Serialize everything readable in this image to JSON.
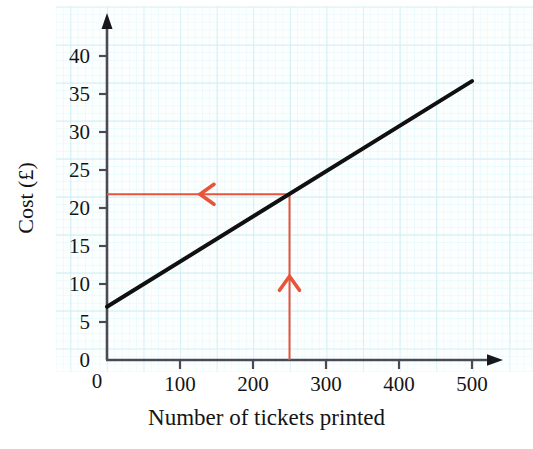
{
  "chart_data": {
    "type": "line",
    "title": "",
    "subtitle": "",
    "xlabel": "Number of tickets printed",
    "ylabel": "Cost (£)",
    "xlim": [
      0,
      540
    ],
    "ylim": [
      0,
      43
    ],
    "xticks": [
      0,
      100,
      200,
      300,
      400,
      500
    ],
    "yticks": [
      0,
      5,
      10,
      15,
      20,
      25,
      30,
      35,
      40
    ],
    "xtick_labels": [
      "0",
      "100",
      "200",
      "300",
      "400",
      "500"
    ],
    "ytick_labels": [
      "0",
      "5",
      "10",
      "15",
      "20",
      "25",
      "30",
      "35",
      "40"
    ],
    "grid": true,
    "grid_minor": true,
    "legend": false,
    "legend_position": "none",
    "series": [
      {
        "name": "Cost of printing tickets",
        "color": "#101010",
        "line_width": 4,
        "x": [
          0,
          500
        ],
        "y": [
          7,
          36.7
        ],
        "intercept": 7,
        "slope_per_100": 5.94
      }
    ],
    "annotations": [
      {
        "name": "reading-vertical",
        "type": "arrow",
        "color": "#e8533a",
        "direction": "up",
        "from_x": 250,
        "from_y": 0,
        "to_x": 250,
        "to_y": 21.8,
        "label": ""
      },
      {
        "name": "reading-horizontal",
        "type": "arrow",
        "color": "#e8533a",
        "direction": "left",
        "from_x": 250,
        "from_y": 21.8,
        "to_x": 0,
        "to_y": 21.8,
        "label": ""
      }
    ],
    "reading": {
      "x_value": 250,
      "y_value": 21.8,
      "x_units": "tickets",
      "y_units": "£"
    },
    "colors": {
      "line": "#101010",
      "axis": "#3a3a44",
      "annotation": "#e8533a",
      "grid_major": "#cfeef3",
      "grid_minor": "#eafafc",
      "background": "#fdffff"
    }
  }
}
